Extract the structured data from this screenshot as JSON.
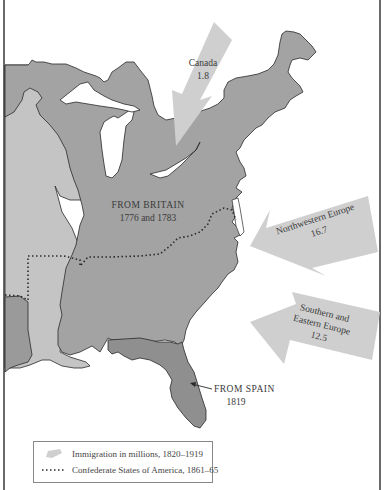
{
  "map": {
    "colors": {
      "water": "#ffffff",
      "british_territory": "#a3a3a3",
      "western_territory": "#c4c4c4",
      "spanish_territory": "#8f8f8f",
      "arrow": "#cfcfcf",
      "outline": "#2a2a2a",
      "frame": "#6a6a6a"
    },
    "regions": [
      {
        "label": "FROM BRITAIN",
        "date": "1776 and 1783"
      },
      {
        "label": "FROM SPAIN",
        "date": "1819"
      }
    ],
    "arrows": [
      {
        "origin": "Canada",
        "value": "1.8"
      },
      {
        "origin": "Northwestern Europe",
        "value": "16.7"
      },
      {
        "origin_line1": "Southern and",
        "origin_line2": "Eastern Europe",
        "value": "12.5"
      }
    ]
  },
  "legend": {
    "items": [
      {
        "icon": "gray-arrow-swatch",
        "label": "Immigration in millions, 1820–1919"
      },
      {
        "icon": "dotted-line-swatch",
        "label": "Confederate States of America, 1861–65"
      }
    ]
  }
}
